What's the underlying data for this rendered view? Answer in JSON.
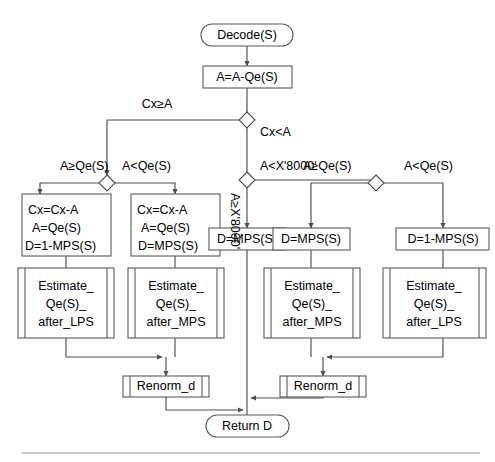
{
  "diagram": {
    "colors": {
      "background": "#ffffff",
      "stroke": "#595959",
      "connector": "#4d4d4d",
      "text": "#000000",
      "rule": "#8c8c8c"
    },
    "nodes": {
      "start": {
        "label": "Decode(S)",
        "shape": "terminal"
      },
      "a_minus_qe": {
        "label": "A=A-Qe(S)",
        "shape": "process"
      },
      "left_lps_box": {
        "shape": "process",
        "line1": "Cx=Cx-A",
        "line2": "A=Qe(S)",
        "line3": "D=1-MPS(S)"
      },
      "left_mps_box": {
        "shape": "process",
        "line1": "Cx=Cx-A",
        "line2": "A=Qe(S)",
        "line3": "D=MPS(S)"
      },
      "center_mps_box": {
        "label": "D=MPS(S)",
        "shape": "process"
      },
      "right_mps_box": {
        "label": "D=MPS(S)",
        "shape": "process"
      },
      "right_lps_box": {
        "label": "D=1-MPS(S)",
        "shape": "process"
      },
      "est_after_lps_left": {
        "shape": "subroutine",
        "line1": "Estimate_",
        "line2": "Qe(S)_",
        "line3": "after_LPS"
      },
      "est_after_mps_left": {
        "shape": "subroutine",
        "line1": "Estimate_",
        "line2": "Qe(S)_",
        "line3": "after_MPS"
      },
      "est_after_mps_right": {
        "shape": "subroutine",
        "line1": "Estimate_",
        "line2": "Qe(S)_",
        "line3": "after_MPS"
      },
      "est_after_lps_right": {
        "shape": "subroutine",
        "line1": "Estimate_",
        "line2": "Qe(S)_",
        "line3": "after_LPS"
      },
      "renorm_left": {
        "label": "Renorm_d",
        "shape": "subroutine"
      },
      "renorm_right": {
        "label": "Renorm_d",
        "shape": "subroutine"
      },
      "end": {
        "label": "Return D",
        "shape": "terminal"
      }
    },
    "decisions": {
      "cx_vs_a": {
        "left_label": "Cx≥A",
        "right_label": "Cx<A"
      },
      "a_vs_x8000": {
        "down_label": "A≥X'8000'",
        "right_label": "A<X'8000'"
      },
      "left_a_vs_qe": {
        "left_label": "A≥Qe(S)",
        "right_label": "A<Qe(S)"
      },
      "right_a_vs_qe": {
        "left_label": "A≥Qe(S)",
        "right_label": "A<Qe(S)"
      }
    }
  }
}
